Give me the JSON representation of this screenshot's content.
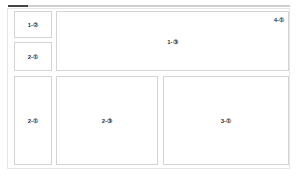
{
  "progress": {
    "fill_percent": 7,
    "fill_color": "#444444",
    "track_color": "#cfcfcf"
  },
  "panels": [
    {
      "id": "p1",
      "label": "1-②"
    },
    {
      "id": "p2",
      "label": "2-①"
    },
    {
      "id": "p3",
      "label": "1-③",
      "corner_label": "4-①"
    },
    {
      "id": "p4",
      "label": "2-①"
    },
    {
      "id": "p5",
      "label": "2-③"
    },
    {
      "id": "p6",
      "label": "3-①"
    }
  ]
}
